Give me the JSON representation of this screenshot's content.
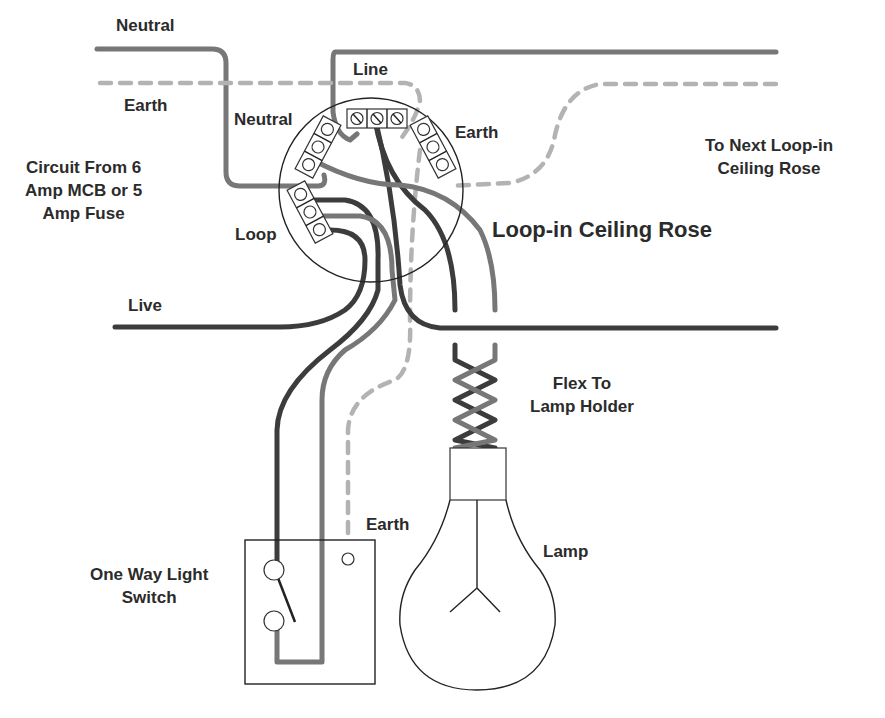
{
  "diagram": {
    "title": "Loop-in Ceiling Rose",
    "labels": {
      "neutral_top": "Neutral",
      "earth_left": "Earth",
      "line": "Line",
      "neutral_rose": "Neutral",
      "earth_rose": "Earth",
      "to_next": "To Next Loop-in\nCeiling Rose",
      "circuit_from": "Circuit From 6\nAmp MCB or 5\nAmp Fuse",
      "loop": "Loop",
      "rose_title": "Loop-in Ceiling Rose",
      "live": "Live",
      "flex": "Flex To\nLamp Holder",
      "earth_switch": "Earth",
      "lamp": "Lamp",
      "switch": "One Way Light\nSwitch"
    },
    "components": [
      {
        "name": "Loop-in Ceiling Rose",
        "terminal_blocks": [
          "Neutral (3)",
          "Line (3)",
          "Earth (3)",
          "Loop (3)"
        ]
      },
      {
        "name": "One Way Light Switch",
        "terminals": 2,
        "earth_terminal": 1
      },
      {
        "name": "Flex To Lamp Holder"
      },
      {
        "name": "Lamp"
      }
    ],
    "wire_colors": {
      "live_line": "#3c3c3c",
      "neutral": "#777777",
      "earth": "#b3b3b3"
    }
  }
}
